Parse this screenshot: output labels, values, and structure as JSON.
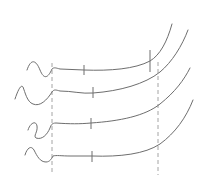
{
  "diagram": {
    "type": "line-drawing",
    "colors": {
      "stroke": "#6e6e6e",
      "guide": "#9a9a9a",
      "background": "#ffffff"
    },
    "guides": [
      {
        "name": "left-guide",
        "x": 52,
        "y1": 63,
        "y2": 175
      },
      {
        "name": "right-guide",
        "x": 158,
        "y1": 62,
        "y2": 175
      }
    ],
    "curves": [
      {
        "name": "curve-1",
        "path": "M27,70 C31,58 36,60 40,70 C44,80 48,78 52,69 C54,67 56,68 60,69 L84,70 C110,71 135,69 150,61 C160,55 167,42 172,24",
        "ticks": [
          {
            "x": 84,
            "y1": 65,
            "y2": 75
          },
          {
            "x": 150,
            "y1": 50,
            "y2": 72
          }
        ]
      },
      {
        "name": "curve-2",
        "path": "M15,99 C18,90 21,84 23,87 C25,92 27,102 33,104 C40,107 47,100 52,92 C54,89 56,90 60,91 C72,91 82,94 93,93 C120,91 145,84 160,72 C172,62 182,46 188,30",
        "ticks": [
          {
            "x": 93,
            "y1": 87,
            "y2": 98
          }
        ]
      },
      {
        "name": "curve-3",
        "path": "M28,130 C30,123 36,120 37,126 C38,132 33,136 36,138 C42,140 47,135 50,128 C51,125 52,123 56,123 C70,124 80,124 91,123 C120,121 145,116 160,104 C175,92 184,80 190,68",
        "ticks": [
          {
            "x": 91,
            "y1": 118,
            "y2": 129
          }
        ]
      },
      {
        "name": "curve-4",
        "path": "M25,155 C27,148 31,145 34,150 C37,156 40,162 46,162 C50,162 52,158 53,156 C56,155 62,156 70,156 L92,156 C120,157 145,154 160,144 C175,133 186,118 193,100",
        "ticks": [
          {
            "x": 92,
            "y1": 151,
            "y2": 162
          }
        ]
      }
    ]
  }
}
